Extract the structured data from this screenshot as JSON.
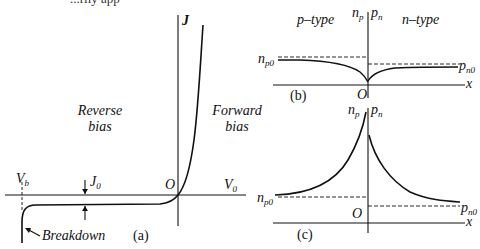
{
  "header_fragment": "...rily app",
  "panels": {
    "a": {
      "caption": "(a)",
      "y_axis": "J",
      "x_axis": "V",
      "x_axis_sub": "0",
      "origin": "O",
      "breakdown_voltage": "V",
      "breakdown_voltage_sub": "b",
      "saturation_current": "J",
      "saturation_current_sub": "0",
      "region_reverse": [
        "Reverse",
        "bias"
      ],
      "region_forward": [
        "Forward",
        "bias"
      ],
      "breakdown_label": "Breakdown"
    },
    "b": {
      "caption": "(b)",
      "left_region": "p–type",
      "right_region": "n–type",
      "left_axis": "n",
      "left_axis_sub": "p",
      "right_axis": "p",
      "right_axis_sub": "n",
      "x_axis": "x",
      "origin": "O",
      "left_eq": "n",
      "left_eq_sub": "p0",
      "right_eq": "p",
      "right_eq_sub": "n0"
    },
    "c": {
      "caption": "(c)",
      "left_axis": "n",
      "left_axis_sub": "p",
      "right_axis": "p",
      "right_axis_sub": "n",
      "x_axis": "x",
      "origin": "O",
      "left_eq": "n",
      "left_eq_sub": "p0",
      "right_eq": "p",
      "right_eq_sub": "n0"
    }
  }
}
